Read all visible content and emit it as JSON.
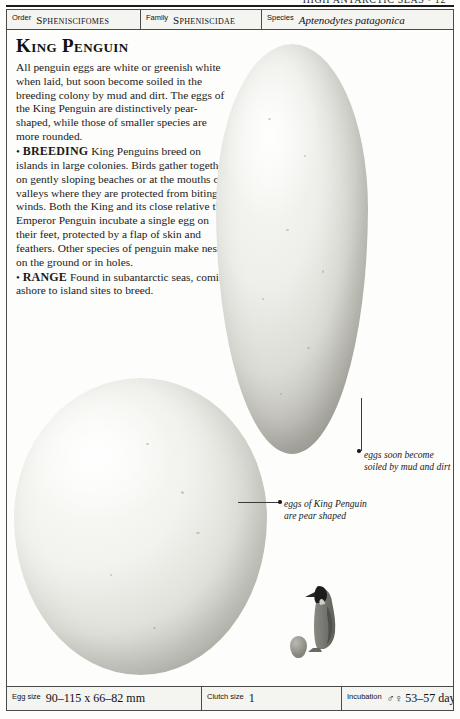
{
  "running_head": "HIGH ANTARCTIC SEAS  •  12",
  "taxonomy": {
    "order": {
      "label": "Order",
      "value": "Spheniscifomes"
    },
    "family": {
      "label": "Family",
      "value": "Spheniscidae"
    },
    "species": {
      "label": "Species",
      "value": "Aptenodytes patagonica"
    }
  },
  "article": {
    "title": "King Penguin",
    "intro": "All penguin eggs are white or greenish white when laid, but soon become soiled in the breeding colony by mud and dirt. The eggs of the King Penguin are distinctively pear-shaped, while those of smaller species are more rounded.",
    "sections": [
      {
        "bullet": "•",
        "keyword": "BREEDING",
        "text": "King Penguins breed on islands in large colonies. Birds gather together on gently sloping beaches or at the mouths of valleys where they are protected from biting winds. Both the King and its close relative the Emperor Penguin incubate a single egg on their feet, protected by a flap of skin and feathers. Other species of penguin make nests on the ground or in holes."
      },
      {
        "bullet": "•",
        "keyword": "RANGE",
        "text": "Found in subantarctic seas, coming ashore to island sites to breed."
      }
    ]
  },
  "captions": {
    "soiled": "eggs soon become soiled by mud and dirt",
    "pear": "eggs of King Penguin are pear shaped"
  },
  "figures": {
    "egg_large_top": "king-penguin-egg-upper",
    "egg_large_bottom": "king-penguin-egg-lower",
    "penguin_silhouette": "king-penguin-bird",
    "scale_egg": "scale-reference-egg"
  },
  "data_bar": {
    "egg_size": {
      "label": "Egg size",
      "value": "90–115 x 66–82 mm"
    },
    "clutch_size": {
      "label": "Clutch size",
      "value": "1"
    },
    "incubation": {
      "label": "Incubation",
      "sex": "♂♀",
      "value": "53–57 days"
    }
  },
  "colors": {
    "ink": "#1a1a1a",
    "rule": "#4a4a4a",
    "panel": "#f4f4f1",
    "page": "#fdfdfb"
  }
}
